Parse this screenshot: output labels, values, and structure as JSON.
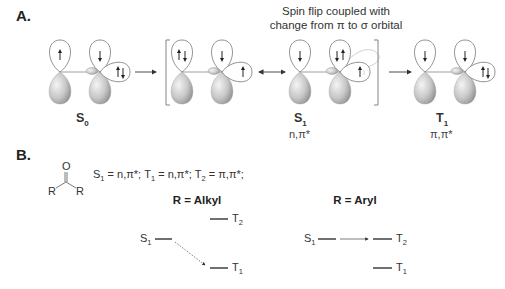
{
  "panel_a": {
    "label": "A.",
    "caption_line1": "Spin flip coupled with",
    "caption_line2": "change from π to σ orbital",
    "states": [
      {
        "name": "S",
        "sub": "0",
        "config": ""
      },
      {
        "name": "S",
        "sub": "1",
        "config": "n,π*"
      },
      {
        "name": "T",
        "sub": "1",
        "config": "π,π*"
      }
    ],
    "arrows": [
      "forward",
      "resonance",
      "forward"
    ]
  },
  "panel_b": {
    "label": "B.",
    "structure": {
      "top_atom": "O",
      "left_group": "R",
      "right_group": "R"
    },
    "equation": {
      "s1_name": "S",
      "s1_sub": "1",
      "s1_val": " = n,π*; ",
      "t1_name": "T",
      "t1_sub": "1",
      "t1_val": " = n,π*; ",
      "t2_name": "T",
      "t2_sub": "2",
      "t2_val": " = π,π*;"
    },
    "alkyl": {
      "title": "R = Alkyl",
      "levels": [
        {
          "name": "S",
          "sub": "1"
        },
        {
          "name": "T",
          "sub": "2"
        },
        {
          "name": "T",
          "sub": "1"
        }
      ],
      "transition": "S1 → T1 (dashed)"
    },
    "aryl": {
      "title": "R = Aryl",
      "levels": [
        {
          "name": "S",
          "sub": "1"
        },
        {
          "name": "T",
          "sub": "2"
        },
        {
          "name": "T",
          "sub": "1"
        }
      ],
      "transition": "S1 → T2"
    }
  }
}
